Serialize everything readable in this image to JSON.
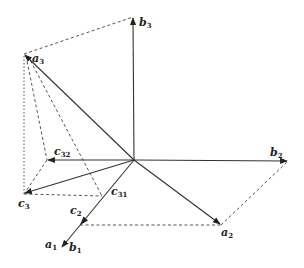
{
  "diagram": {
    "type": "vector-diagram",
    "origin": {
      "x": 134,
      "y": 160
    },
    "vectors": [
      {
        "id": "a1",
        "label": "a",
        "sub": "1",
        "to": {
          "x": 62,
          "y": 247
        }
      },
      {
        "id": "a2",
        "label": "a",
        "sub": "2",
        "to": {
          "x": 221,
          "y": 225
        }
      },
      {
        "id": "a3",
        "label": "a",
        "sub": "3",
        "to": {
          "x": 24,
          "y": 54
        }
      },
      {
        "id": "b2",
        "label": "b",
        "sub": "2",
        "to": {
          "x": 288,
          "y": 161
        }
      },
      {
        "id": "b3",
        "label": "b",
        "sub": "3",
        "to": {
          "x": 133,
          "y": 17
        }
      },
      {
        "id": "c3",
        "label": "c",
        "sub": "3",
        "to": {
          "x": 24,
          "y": 194
        }
      },
      {
        "id": "c32",
        "label": "c",
        "sub": "32",
        "to": {
          "x": 47,
          "y": 160
        }
      }
    ],
    "points": [
      {
        "id": "c2",
        "label": "c",
        "sub": "2",
        "x": 80,
        "y": 225
      },
      {
        "id": "c31",
        "label": "c",
        "sub": "31",
        "x": 102,
        "y": 196
      },
      {
        "id": "b1",
        "label": "b",
        "sub": "1",
        "x": 62,
        "y": 247
      }
    ],
    "dashed_lines": [
      {
        "from": "a3",
        "to": "b3"
      },
      {
        "from": "a3",
        "to": "c3"
      },
      {
        "from": "a3",
        "to": "c32"
      },
      {
        "from": "a3",
        "to": "c31"
      },
      {
        "from": "c32",
        "to": "c3"
      },
      {
        "from": "c3",
        "to": "c31"
      },
      {
        "from": "c2",
        "to": "a2"
      },
      {
        "from": "a2",
        "to": "b2"
      }
    ],
    "labels": {
      "a1": {
        "base": "a",
        "sub": "1"
      },
      "a2": {
        "base": "a",
        "sub": "2"
      },
      "a3": {
        "base": "a",
        "sub": "3"
      },
      "b1": {
        "base": "b",
        "sub": "1"
      },
      "b2": {
        "base": "b",
        "sub": "2"
      },
      "b3": {
        "base": "b",
        "sub": "3"
      },
      "c2": {
        "base": "c",
        "sub": "2"
      },
      "c3": {
        "base": "c",
        "sub": "3"
      },
      "c31": {
        "base": "c",
        "sub": "31"
      },
      "c32": {
        "base": "c",
        "sub": "32"
      }
    },
    "colors": {
      "line": "#333333",
      "dash": "#555555",
      "background": "#ffffff"
    }
  }
}
